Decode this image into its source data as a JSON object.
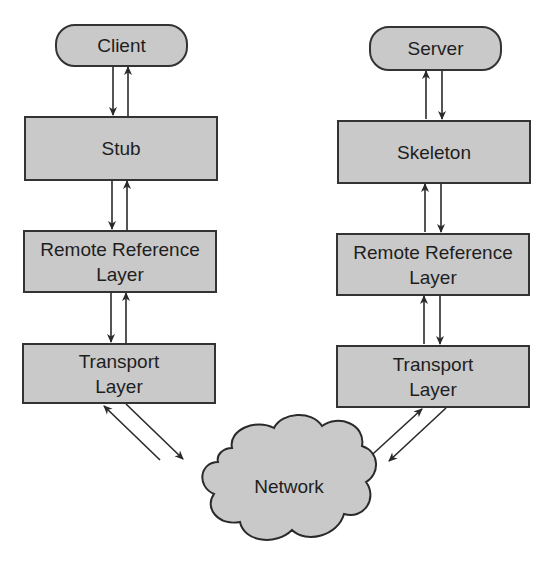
{
  "diagram": {
    "type": "rmi-architecture",
    "client_side": {
      "client": "Client",
      "stub": "Stub",
      "remote_reference_layer": "Remote Reference\nLayer",
      "transport_layer": "Transport\nLayer"
    },
    "server_side": {
      "server": "Server",
      "skeleton": "Skeleton",
      "remote_reference_layer": "Remote Reference\nLayer",
      "transport_layer": "Transport\nLayer"
    },
    "network": "Network",
    "colors": {
      "fill": "#c9c9c9",
      "stroke": "#333333",
      "text": "#1e1e1e"
    },
    "edges": [
      {
        "from": "Client",
        "to": "Stub",
        "bidirectional": true
      },
      {
        "from": "Stub",
        "to": "Remote Reference Layer (client)",
        "bidirectional": true
      },
      {
        "from": "Remote Reference Layer (client)",
        "to": "Transport Layer (client)",
        "bidirectional": true
      },
      {
        "from": "Transport Layer (client)",
        "to": "Network",
        "bidirectional": true
      },
      {
        "from": "Network",
        "to": "Transport Layer (server)",
        "bidirectional": true
      },
      {
        "from": "Transport Layer (server)",
        "to": "Remote Reference Layer (server)",
        "bidirectional": true
      },
      {
        "from": "Remote Reference Layer (server)",
        "to": "Skeleton",
        "bidirectional": true
      },
      {
        "from": "Skeleton",
        "to": "Server",
        "bidirectional": true
      }
    ]
  }
}
